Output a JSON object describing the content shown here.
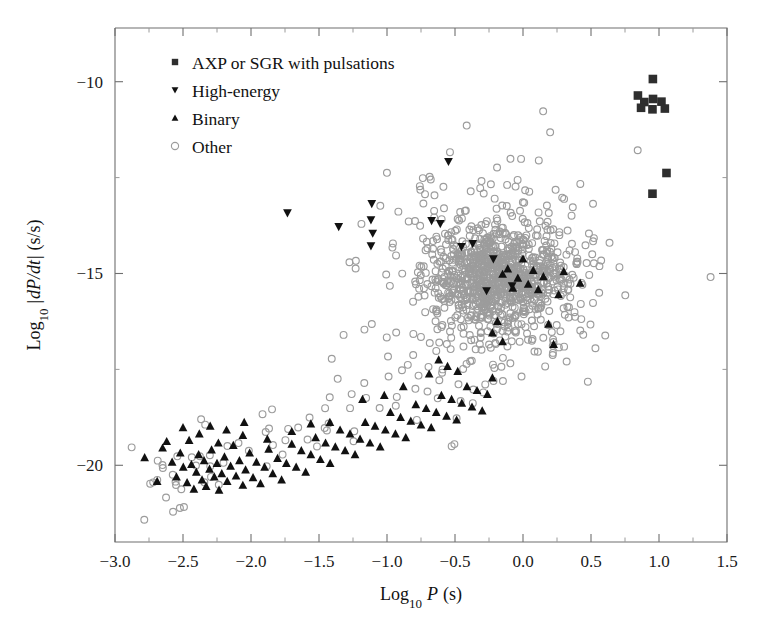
{
  "figure": {
    "type": "scatter",
    "background": "#ffffff",
    "plot_frame": {
      "x0": 115,
      "y0": 28,
      "x1": 727,
      "y1": 542
    }
  },
  "chart_data": {
    "type": "scatter",
    "title": "",
    "xlabel": "Log",
    "xlabel_sub": "10",
    "xlabel_var": "P",
    "xlabel_unit": "(s)",
    "ylabel": "Log",
    "ylabel_sub": "10",
    "ylabel_var": "dP/dt",
    "ylabel_unit": "(s/s)",
    "xlim": [
      -3.0,
      1.5
    ],
    "ylim": [
      -22.0,
      -8.6
    ],
    "xticks": [
      -3.0,
      -2.5,
      -2.0,
      -1.5,
      -1.0,
      -0.5,
      0.0,
      0.5,
      1.0,
      1.5
    ],
    "xticklabels": [
      "-3.0",
      "-2.5",
      "-2.0",
      "-1.5",
      "-1.0",
      "-0.5",
      "0.0",
      "0.5",
      "1.0",
      "1.5"
    ],
    "yticks": [
      -10,
      -15,
      -20
    ],
    "yticklabels": [
      "-10",
      "-15",
      "-20"
    ],
    "yticks_minor": [
      -12.5,
      -17.5
    ],
    "grid": false,
    "legend_position": "upper-left",
    "series": [
      {
        "name": "AXP or SGR with pulsations",
        "marker": "square",
        "color": "#2e2e2e",
        "filled": true,
        "points": [
          [
            0.955,
            -9.93
          ],
          [
            0.845,
            -10.36
          ],
          [
            0.892,
            -10.53
          ],
          [
            0.956,
            -10.45
          ],
          [
            0.868,
            -10.68
          ],
          [
            1.018,
            -10.52
          ],
          [
            1.043,
            -10.7
          ],
          [
            0.952,
            -10.72
          ],
          [
            1.055,
            -12.38
          ],
          [
            0.952,
            -12.92
          ]
        ]
      },
      {
        "name": "High-energy",
        "marker": "triangle-down",
        "color": "#111111",
        "filled": true,
        "points": [
          [
            -0.548,
            -12.08
          ],
          [
            -1.732,
            -13.42
          ],
          [
            -1.112,
            -13.18
          ],
          [
            -1.118,
            -13.6
          ],
          [
            -1.105,
            -13.95
          ],
          [
            -1.118,
            -14.28
          ],
          [
            -1.355,
            -13.78
          ],
          [
            -0.672,
            -13.62
          ],
          [
            -0.608,
            -13.7
          ],
          [
            -0.37,
            -14.22
          ],
          [
            -0.452,
            -14.3
          ],
          [
            -0.218,
            -14.62
          ],
          [
            -0.268,
            -15.45
          ],
          [
            -0.08,
            -15.32
          ]
        ]
      },
      {
        "name": "Binary",
        "marker": "triangle-up",
        "color": "#111111",
        "filled": true,
        "points": [
          [
            -2.782,
            -19.8
          ],
          [
            -2.69,
            -20.42
          ],
          [
            -2.65,
            -19.55
          ],
          [
            -2.58,
            -19.92
          ],
          [
            -2.548,
            -20.3
          ],
          [
            -2.52,
            -19.68
          ],
          [
            -2.498,
            -20.05
          ],
          [
            -2.47,
            -20.45
          ],
          [
            -2.455,
            -19.35
          ],
          [
            -2.438,
            -19.98
          ],
          [
            -2.42,
            -20.62
          ],
          [
            -2.402,
            -20.18
          ],
          [
            -2.385,
            -19.72
          ],
          [
            -2.36,
            -20.38
          ],
          [
            -2.345,
            -19.88
          ],
          [
            -2.33,
            -20.55
          ],
          [
            -2.305,
            -20.1
          ],
          [
            -2.29,
            -19.6
          ],
          [
            -2.27,
            -20.3
          ],
          [
            -2.25,
            -19.95
          ],
          [
            -2.235,
            -20.65
          ],
          [
            -2.215,
            -20.22
          ],
          [
            -2.195,
            -19.78
          ],
          [
            -2.175,
            -20.42
          ],
          [
            -2.15,
            -20.02
          ],
          [
            -2.13,
            -19.48
          ],
          [
            -2.11,
            -20.28
          ],
          [
            -2.085,
            -19.88
          ],
          [
            -2.06,
            -20.52
          ],
          [
            -2.04,
            -20.12
          ],
          [
            -2.01,
            -19.68
          ],
          [
            -1.985,
            -20.32
          ],
          [
            -1.96,
            -19.92
          ],
          [
            -1.93,
            -20.48
          ],
          [
            -1.9,
            -20.05
          ],
          [
            -1.87,
            -19.58
          ],
          [
            -1.84,
            -20.22
          ],
          [
            -1.805,
            -19.82
          ],
          [
            -1.775,
            -20.38
          ],
          [
            -1.74,
            -19.95
          ],
          [
            -1.7,
            -19.45
          ],
          [
            -1.668,
            -20.05
          ],
          [
            -1.63,
            -19.62
          ],
          [
            -1.598,
            -20.18
          ],
          [
            -1.56,
            -19.72
          ],
          [
            -1.525,
            -19.28
          ],
          [
            -1.49,
            -19.85
          ],
          [
            -1.452,
            -19.42
          ],
          [
            -1.418,
            -19.95
          ],
          [
            -1.38,
            -19.52
          ],
          [
            -1.345,
            -19.08
          ],
          [
            -1.308,
            -19.62
          ],
          [
            -1.272,
            -19.18
          ],
          [
            -1.235,
            -19.72
          ],
          [
            -1.198,
            -19.32
          ],
          [
            -1.16,
            -18.88
          ],
          [
            -1.125,
            -19.42
          ],
          [
            -1.088,
            -18.98
          ],
          [
            -1.05,
            -19.52
          ],
          [
            -1.012,
            -19.08
          ],
          [
            -0.975,
            -18.62
          ],
          [
            -0.938,
            -19.18
          ],
          [
            -0.9,
            -18.75
          ],
          [
            -0.862,
            -19.28
          ],
          [
            -0.825,
            -18.85
          ],
          [
            -0.788,
            -18.42
          ],
          [
            -0.75,
            -18.95
          ],
          [
            -0.712,
            -18.52
          ],
          [
            -0.675,
            -19.02
          ],
          [
            -0.638,
            -18.62
          ],
          [
            -0.6,
            -18.18
          ],
          [
            -0.562,
            -18.72
          ],
          [
            -0.525,
            -18.28
          ],
          [
            -0.488,
            -18.82
          ],
          [
            -0.45,
            -18.38
          ],
          [
            -0.412,
            -17.95
          ],
          [
            -0.375,
            -18.48
          ],
          [
            -0.338,
            -18.05
          ],
          [
            -0.3,
            -18.58
          ],
          [
            -0.262,
            -18.15
          ],
          [
            -0.225,
            -17.72
          ],
          [
            -0.188,
            -16.25
          ],
          [
            -0.15,
            -15.02
          ],
          [
            -0.112,
            -14.88
          ],
          [
            -0.075,
            -15.38
          ],
          [
            -0.038,
            -15.12
          ],
          [
            0.0,
            -14.62
          ],
          [
            0.038,
            -15.28
          ],
          [
            0.075,
            -14.92
          ],
          [
            0.112,
            -15.42
          ],
          [
            0.15,
            -15.08
          ],
          [
            0.188,
            -16.32
          ],
          [
            0.225,
            -16.85
          ],
          [
            0.262,
            -15.55
          ],
          [
            0.3,
            -14.95
          ],
          [
            0.42,
            -15.25
          ],
          [
            -0.225,
            -16.55
          ],
          [
            -0.15,
            -16.78
          ],
          [
            -0.48,
            -17.55
          ],
          [
            -0.555,
            -17.42
          ],
          [
            -0.62,
            -17.25
          ],
          [
            -0.69,
            -17.62
          ],
          [
            -0.88,
            -17.95
          ],
          [
            -1.02,
            -18.18
          ],
          [
            -1.18,
            -18.28
          ],
          [
            -1.42,
            -18.88
          ],
          [
            -1.56,
            -18.92
          ],
          [
            -1.7,
            -19.12
          ],
          [
            -1.88,
            -19.32
          ],
          [
            -2.06,
            -19.22
          ],
          [
            -2.24,
            -19.42
          ],
          [
            -2.38,
            -19.18
          ],
          [
            -2.5,
            -19.02
          ],
          [
            -2.62,
            -19.38
          ],
          [
            -2.3,
            -18.98
          ],
          [
            -2.18,
            -19.08
          ],
          [
            -2.05,
            -18.88
          ]
        ]
      },
      {
        "name": "Other",
        "marker": "circle-open",
        "color": "#9c9c9c",
        "filled": false,
        "cluster_center": [
          -0.18,
          -15.05
        ],
        "cluster_spread": [
          0.42,
          1.35
        ],
        "count": 1200
      }
    ]
  },
  "legend": {
    "items": [
      {
        "label": "AXP or SGR with pulsations",
        "marker": "square"
      },
      {
        "label": "High-energy",
        "marker": "triangle-down"
      },
      {
        "label": "Binary",
        "marker": "triangle-up"
      },
      {
        "label": "Other",
        "marker": "circle-open"
      }
    ]
  }
}
